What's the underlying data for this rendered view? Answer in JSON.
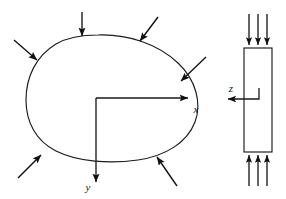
{
  "figure": {
    "background_color": "#ffffff",
    "line_color": "#1a1a1a",
    "arrow_color": "#111111"
  },
  "plan_view": {
    "name": "plate-plan-view",
    "outline_description": "irregular closed plate boundary",
    "axes": {
      "origin": {
        "x": 96,
        "y": 98
      },
      "x_axis": {
        "label": "x",
        "label_x": 196,
        "label_y": 112,
        "from": {
          "x": 96,
          "y": 98
        },
        "to": {
          "x": 190,
          "y": 98
        }
      },
      "y_axis": {
        "label": "y",
        "label_x": 89,
        "label_y": 190,
        "from": {
          "x": 96,
          "y": 98
        },
        "to": {
          "x": 96,
          "y": 184
        }
      }
    },
    "load_arrows": [
      {
        "name": "load-arrow-top",
        "x1": 82,
        "y1": 12,
        "x2": 82,
        "y2": 38
      },
      {
        "name": "load-arrow-top-right",
        "x1": 158,
        "y1": 17,
        "x2": 139,
        "y2": 42
      },
      {
        "name": "load-arrow-upper-left",
        "x1": 14,
        "y1": 40,
        "x2": 38,
        "y2": 61
      },
      {
        "name": "load-arrow-right",
        "x1": 206,
        "y1": 57,
        "x2": 180,
        "y2": 82
      },
      {
        "name": "load-arrow-lower-left",
        "x1": 18,
        "y1": 178,
        "x2": 42,
        "y2": 154
      },
      {
        "name": "load-arrow-bottom-right",
        "x1": 177,
        "y1": 186,
        "x2": 156,
        "y2": 155
      }
    ]
  },
  "edge_view": {
    "name": "plate-edge-view",
    "plate": {
      "x": 244,
      "y": 48,
      "width": 28,
      "height": 104
    },
    "z_axis": {
      "label": "z",
      "label_x": 231,
      "label_y": 92,
      "from": {
        "x": 259,
        "y": 99
      },
      "to": {
        "x": 226,
        "y": 99
      }
    },
    "top_arrows": [
      {
        "name": "edge-load-arrow-top-1",
        "x": 249,
        "y1": 14,
        "y2": 47
      },
      {
        "name": "edge-load-arrow-top-2",
        "x": 258,
        "y1": 14,
        "y2": 47
      },
      {
        "name": "edge-load-arrow-top-3",
        "x": 267,
        "y1": 14,
        "y2": 47
      }
    ],
    "bottom_arrows": [
      {
        "name": "edge-load-arrow-bottom-1",
        "x": 249,
        "y1": 186,
        "y2": 153
      },
      {
        "name": "edge-load-arrow-bottom-2",
        "x": 258,
        "y1": 186,
        "y2": 153
      },
      {
        "name": "edge-load-arrow-bottom-3",
        "x": 267,
        "y1": 186,
        "y2": 153
      }
    ]
  }
}
